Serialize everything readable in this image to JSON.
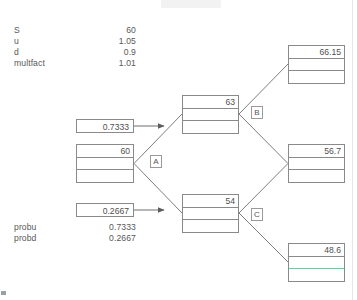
{
  "diagram": {
    "type": "binomial-tree",
    "parameters": [
      {
        "key": "S",
        "value": "60"
      },
      {
        "key": "u",
        "value": "1.05"
      },
      {
        "key": "d",
        "value": "0.9"
      },
      {
        "key": "multfact",
        "value": "1.01"
      }
    ],
    "probabilities": [
      {
        "key": "probu",
        "value": "0.7333"
      },
      {
        "key": "probd",
        "value": "0.2667"
      }
    ],
    "prob_boxes": [
      {
        "name": "prob-up-box",
        "value": "0.7333"
      },
      {
        "name": "prob-down-box",
        "value": "0.2667"
      }
    ],
    "nodes": [
      {
        "id": "root",
        "label": "60",
        "rows": [
          "60",
          "",
          ""
        ]
      },
      {
        "id": "up",
        "label": "63",
        "rows": [
          "63",
          "",
          ""
        ]
      },
      {
        "id": "down",
        "label": "54",
        "rows": [
          "54",
          "",
          ""
        ]
      },
      {
        "id": "upup",
        "label": "66.15",
        "rows": [
          "66.15",
          "",
          ""
        ]
      },
      {
        "id": "updown",
        "label": "56.7",
        "rows": [
          "56.7",
          "",
          ""
        ]
      },
      {
        "id": "downdown",
        "label": "48.6",
        "rows": [
          "48.6",
          "",
          ""
        ]
      }
    ],
    "tags": [
      {
        "id": "tag-a",
        "label": "A"
      },
      {
        "id": "tag-b",
        "label": "B"
      },
      {
        "id": "tag-c",
        "label": "C"
      }
    ],
    "colors": {
      "border": "#8a8a8a",
      "text": "#4f4f4f",
      "edge": "#6e6e6e",
      "highlight_rule": "#7fc29b",
      "background": "#ffffff"
    }
  }
}
